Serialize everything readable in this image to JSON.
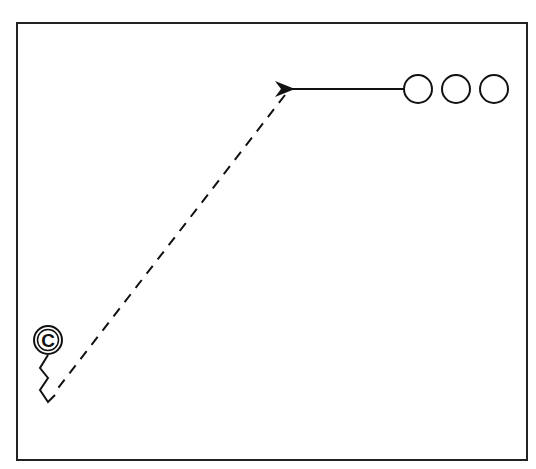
{
  "diagram": {
    "type": "play-diagram",
    "stroke_color": "#111111",
    "background": "#ffffff",
    "frame": {
      "x": 17,
      "y": 23,
      "width": 510,
      "height": 437
    },
    "players": [
      {
        "id": "o1",
        "symbol": "circle",
        "cx": 418,
        "cy": 89,
        "r": 14
      },
      {
        "id": "o2",
        "symbol": "circle",
        "cx": 456,
        "cy": 89,
        "r": 14
      },
      {
        "id": "o3",
        "symbol": "circle",
        "cx": 494,
        "cy": 89,
        "r": 14
      }
    ],
    "center_marker": {
      "label": "C",
      "cx": 48,
      "cy": 340,
      "r": 14
    },
    "pass_arrow": {
      "from": [
        404,
        89
      ],
      "to": [
        287,
        89
      ]
    },
    "dashed_route": {
      "from": [
        285,
        95
      ],
      "to": [
        55,
        392
      ]
    }
  }
}
